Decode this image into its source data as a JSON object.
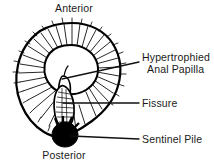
{
  "figure": {
    "background_color": "#ffffff",
    "ink_color": "#000000"
  },
  "orientation_labels": {
    "anterior": "Anterior",
    "posterior": "Posterior"
  },
  "callouts": [
    {
      "id": "hypertrophied-anal-papilla",
      "line1": "Hypertrophied",
      "line2": "Anal Papilla",
      "leader": {
        "x1": 62,
        "y1": 79,
        "x2": 139,
        "y2": 62
      }
    },
    {
      "id": "fissure",
      "line1": "Fissure",
      "line2": "",
      "leader": {
        "x1": 63,
        "y1": 103,
        "x2": 139,
        "y2": 103
      }
    },
    {
      "id": "sentinel-pile",
      "line1": "Sentinel Pile",
      "line2": "",
      "leader": {
        "x1": 71,
        "y1": 136,
        "x2": 139,
        "y2": 139
      }
    }
  ],
  "structures": {
    "perianal_skin": "perianal skin folds with radiating rugae",
    "anal_canal": "central anal orifice",
    "papilla": "hypertrophied anal papilla",
    "fissure": "posterior midline fissure",
    "sentinel_pile": "sentinel pile skin tag"
  }
}
